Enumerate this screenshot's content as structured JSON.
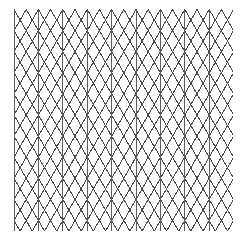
{
  "page": {
    "width": 248,
    "height": 243,
    "background_color": "#ffffff"
  },
  "grid": {
    "name": "triangular-grid",
    "description": "Isometric / triangular graph paper composed of one vertical line family and two diagonal families at plus and minus 60 degrees forming equilateral triangles.",
    "line_color": "#4a4a4a",
    "line_color_secondary": "#5e5e5e",
    "line_width": 1,
    "column_spacing_px": 24.4,
    "row_spacing_px": 21.1,
    "origin_x": 14,
    "origin_y": 9.5,
    "extent_x": 233,
    "extent_y": 231,
    "vertical_line_count": 10,
    "vertex_row_count": 11,
    "diagonal_angle_degrees": 60,
    "families": [
      {
        "name": "vertical",
        "angle_degrees": 90,
        "count": 10
      },
      {
        "name": "diagonal-up-right",
        "angle_degrees": 60,
        "count": 20
      },
      {
        "name": "diagonal-down-right",
        "angle_degrees": -60,
        "count": 20
      }
    ]
  },
  "chart_data": {
    "type": "line",
    "xlabel": "",
    "ylabel": "",
    "xlim": [
      14,
      233
    ],
    "ylim": [
      9.5,
      231
    ],
    "grid": true,
    "legend": "none",
    "series": [
      {
        "name": "vertical lines",
        "values": [
          14,
          38.4,
          62.8,
          87.2,
          111.6,
          136,
          160.4,
          184.8,
          209.2,
          233.6
        ]
      },
      {
        "name": "vertex rows",
        "values": [
          9.5,
          30.6,
          51.7,
          72.8,
          93.9,
          115,
          136.1,
          157.2,
          178.3,
          199.4,
          220.5
        ]
      }
    ]
  }
}
